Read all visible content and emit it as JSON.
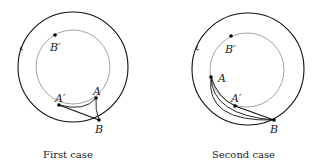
{
  "figures": [
    {
      "caption": "First case",
      "points": {
        "B_prime": "B′",
        "A_prime": "A′",
        "A": "A",
        "B": "B"
      }
    },
    {
      "caption": "Second case",
      "points": {
        "B_prime": "B′",
        "A_prime": "A′",
        "A": "A",
        "B": "B"
      }
    }
  ]
}
